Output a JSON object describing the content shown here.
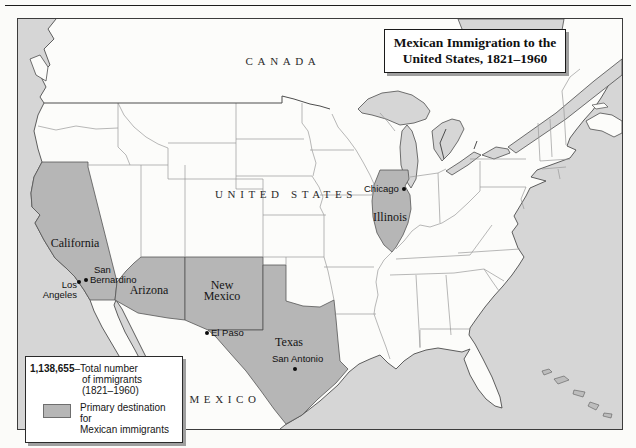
{
  "map": {
    "title_line1": "Mexican Immigration to the",
    "title_line2": "United States, 1821–1960",
    "regions": {
      "canada": "CANADA",
      "united_states": "UNITED STATES",
      "mexico": "MEXICO"
    },
    "states": {
      "california": "California",
      "arizona": "Arizona",
      "new_mexico_line1": "New",
      "new_mexico_line2": "Mexico",
      "texas": "Texas",
      "illinois": "Illinois"
    },
    "cities": {
      "chicago": "Chicago",
      "los_angeles_line1": "Los",
      "los_angeles_line2": "Angeles",
      "san_bernardino_line1": "San",
      "san_bernardino_line2": "Bernardino",
      "el_paso": "El Paso",
      "san_antonio": "San Antonio"
    },
    "highlighted_states": [
      "California",
      "Arizona",
      "New Mexico",
      "Texas",
      "Illinois"
    ]
  },
  "legend": {
    "total_value": "1,138,655",
    "total_line1": "–Total number",
    "total_line2": "of immigrants",
    "total_line3": "(1821–1960)",
    "swatch_line1": "Primary destination for",
    "swatch_line2": "Mexican immigrants"
  },
  "colors": {
    "water": "#d6d6d6",
    "land": "#fcfcfa",
    "highlight": "#b6b6b6",
    "coast": "#4d4d4d",
    "stateline": "#9a9a9a",
    "pagebg": "#fbfbf9"
  }
}
